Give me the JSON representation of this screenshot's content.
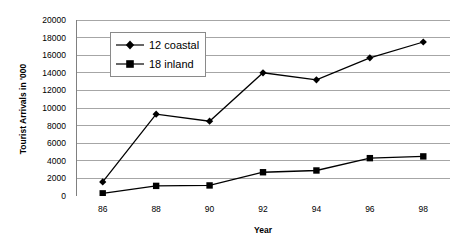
{
  "chart_data": {
    "type": "line",
    "title": "",
    "xlabel": "Year",
    "ylabel": "Tourist Arrivals in '000",
    "x": [
      86,
      88,
      90,
      92,
      94,
      96,
      98
    ],
    "categories": [
      "86",
      "88",
      "90",
      "92",
      "94",
      "96",
      "98"
    ],
    "xlim": [
      85,
      99
    ],
    "ylim": [
      0,
      20000
    ],
    "y_ticks": [
      0,
      2000,
      4000,
      6000,
      8000,
      10000,
      12000,
      14000,
      16000,
      18000,
      20000
    ],
    "y_tick_labels": [
      "0",
      "2000",
      "4000",
      "6000",
      "8000",
      "10000",
      "12000",
      "14000",
      "16000",
      "18000",
      "20000"
    ],
    "grid": "horizontal",
    "legend_position": "top-left-inside",
    "series": [
      {
        "name": "12 coastal",
        "marker": "diamond",
        "color": "#000000",
        "values": [
          1600,
          9300,
          8500,
          14000,
          13200,
          15700,
          17500
        ]
      },
      {
        "name": "18 inland",
        "marker": "square",
        "color": "#000000",
        "values": [
          300,
          1150,
          1200,
          2700,
          2900,
          4300,
          4500
        ]
      }
    ]
  },
  "legend": {
    "items": [
      {
        "label": "12 coastal",
        "marker": "diamond"
      },
      {
        "label": "18 inland",
        "marker": "square"
      }
    ]
  },
  "axes": {
    "y_title": "Tourist Arrivals in '000",
    "x_title": "Year"
  },
  "colors": {
    "series": "#000000",
    "gridline": "#a6a6a6",
    "axis": "#808080",
    "legend_border": "#8a8a8a",
    "background": "#ffffff"
  }
}
